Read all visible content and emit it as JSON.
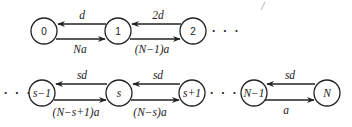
{
  "diagram": {
    "type": "birth-death state transition chain",
    "row1": {
      "nodes": [
        {
          "id": "0",
          "label": "0"
        },
        {
          "id": "1",
          "label": "1"
        },
        {
          "id": "2",
          "label": "2"
        }
      ],
      "edges": [
        {
          "from": "1",
          "to": "0",
          "label": "d",
          "direction": "left"
        },
        {
          "from": "0",
          "to": "1",
          "label": "Na",
          "direction": "right"
        },
        {
          "from": "2",
          "to": "1",
          "label": "2d",
          "direction": "left"
        },
        {
          "from": "1",
          "to": "2",
          "label": "(N−1)a",
          "direction": "right"
        }
      ],
      "trailing_ellipsis": "· · ·"
    },
    "row2": {
      "leading_ellipsis": "· · ·",
      "nodes": [
        {
          "id": "s-1",
          "label": "s−1"
        },
        {
          "id": "s",
          "label": "s"
        },
        {
          "id": "s+1",
          "label": "s+1"
        },
        {
          "id": "N-1",
          "label": "N−1"
        },
        {
          "id": "N",
          "label": "N"
        }
      ],
      "edges": [
        {
          "from": "s",
          "to": "s-1",
          "label": "sd",
          "direction": "left"
        },
        {
          "from": "s-1",
          "to": "s",
          "label": "(N−s+1)a",
          "direction": "right"
        },
        {
          "from": "s+1",
          "to": "s",
          "label": "sd",
          "direction": "left"
        },
        {
          "from": "s",
          "to": "s+1",
          "label": "(N−s)a",
          "direction": "right"
        },
        {
          "from": "N",
          "to": "N-1",
          "label": "sd",
          "direction": "left"
        },
        {
          "from": "N-1",
          "to": "N",
          "label": "a",
          "direction": "right"
        }
      ],
      "middle_ellipsis": "· · ·"
    }
  }
}
